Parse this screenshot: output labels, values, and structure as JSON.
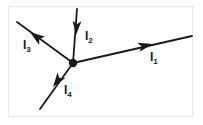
{
  "figure": {
    "type": "circuit-junction-diagram",
    "background_color": "#ffffff",
    "frame_color": "#e9e9e9",
    "ink_color": "#1a1a1a",
    "node": {
      "name": "junction-node",
      "x": 73,
      "y": 63,
      "radius": 4.2
    },
    "labels": [
      {
        "id": "I1",
        "symbol": "I",
        "subscript": "1",
        "x": 150,
        "y": 51
      },
      {
        "id": "I2",
        "symbol": "I",
        "subscript": "2",
        "x": 85,
        "y": 30
      },
      {
        "id": "I3",
        "symbol": "I",
        "subscript": "3",
        "x": 23,
        "y": 39
      },
      {
        "id": "I4",
        "symbol": "I",
        "subscript": "4",
        "x": 64,
        "y": 84
      }
    ],
    "branches": [
      {
        "id": "I1",
        "name": "branch-I1",
        "direction": "outward-right-up",
        "line": {
          "x1": 73,
          "y1": 63,
          "x2": 192,
          "y2": 36
        },
        "arrow_tip": {
          "x": 153,
          "y": 44
        },
        "arrow_angle_deg": -12.8
      },
      {
        "id": "I2",
        "name": "branch-I2",
        "direction": "inward-from-top",
        "line": {
          "x1": 77,
          "y1": 9,
          "x2": 73,
          "y2": 63
        },
        "arrow_tip": {
          "x": 76,
          "y": 35
        },
        "arrow_angle_deg": 94.2
      },
      {
        "id": "I3",
        "name": "branch-I3",
        "direction": "outward-left-up",
        "line": {
          "x1": 73,
          "y1": 63,
          "x2": 17,
          "y2": 22
        },
        "arrow_tip": {
          "x": 30,
          "y": 32
        },
        "arrow_angle_deg": -143.8
      },
      {
        "id": "I4",
        "name": "branch-I4",
        "direction": "outward-left-down",
        "line": {
          "x1": 73,
          "y1": 63,
          "x2": 40,
          "y2": 109
        },
        "arrow_tip": {
          "x": 53,
          "y": 87
        },
        "arrow_angle_deg": 125.6
      }
    ]
  }
}
